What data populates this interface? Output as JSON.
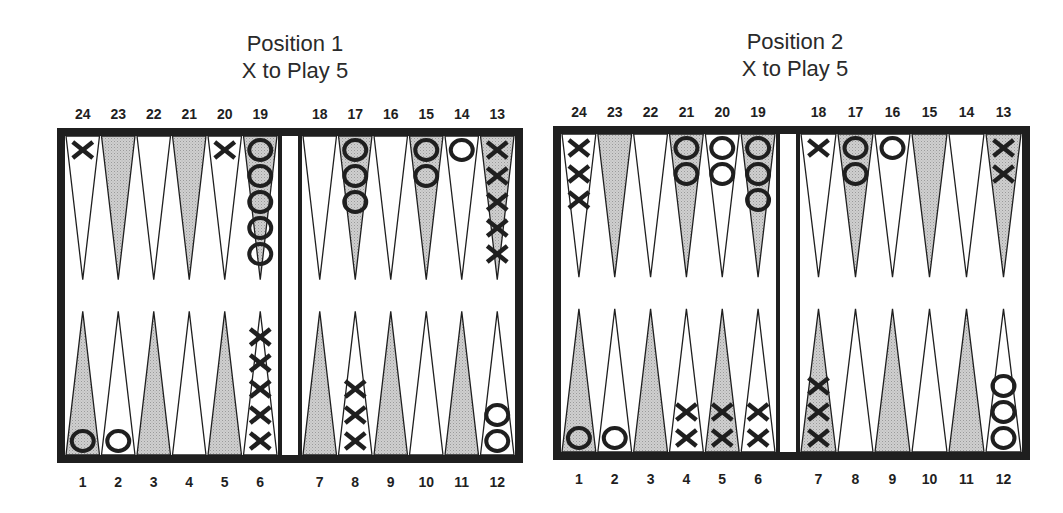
{
  "colors": {
    "ink": "#1f1f1f",
    "shaded_point": "#cfcfcf",
    "light_point": "#ffffff",
    "background": "#ffffff"
  },
  "positions": [
    {
      "title": "Position 1",
      "subtitle": "X to Play 5",
      "board": {
        "x": 57,
        "y": 128,
        "w": 466,
        "h": 335,
        "bar_x": 278,
        "bar_w": 24
      },
      "top_labels": [
        "24",
        "23",
        "22",
        "21",
        "20",
        "19",
        "18",
        "17",
        "16",
        "15",
        "14",
        "13"
      ],
      "bottom_labels": [
        "1",
        "2",
        "3",
        "4",
        "5",
        "6",
        "7",
        "8",
        "9",
        "10",
        "11",
        "12"
      ],
      "points": {
        "1": {
          "player": "O",
          "count": 1
        },
        "2": {
          "player": "O",
          "count": 1
        },
        "3": {
          "player": "",
          "count": 0
        },
        "4": {
          "player": "",
          "count": 0
        },
        "5": {
          "player": "",
          "count": 0
        },
        "6": {
          "player": "X",
          "count": 5
        },
        "7": {
          "player": "",
          "count": 0
        },
        "8": {
          "player": "X",
          "count": 3
        },
        "9": {
          "player": "",
          "count": 0
        },
        "10": {
          "player": "",
          "count": 0
        },
        "11": {
          "player": "",
          "count": 0
        },
        "12": {
          "player": "O",
          "count": 2
        },
        "13": {
          "player": "X",
          "count": 5
        },
        "14": {
          "player": "O",
          "count": 1
        },
        "15": {
          "player": "O",
          "count": 2
        },
        "16": {
          "player": "",
          "count": 0
        },
        "17": {
          "player": "O",
          "count": 3
        },
        "18": {
          "player": "",
          "count": 0
        },
        "19": {
          "player": "O",
          "count": 5
        },
        "20": {
          "player": "X",
          "count": 1
        },
        "21": {
          "player": "",
          "count": 0
        },
        "22": {
          "player": "",
          "count": 0
        },
        "23": {
          "player": "",
          "count": 0
        },
        "24": {
          "player": "X",
          "count": 1
        }
      }
    },
    {
      "title": "Position 2",
      "subtitle": "X to Play 5",
      "board": {
        "x": 553,
        "y": 126,
        "w": 477,
        "h": 334,
        "bar_x": 776,
        "bar_w": 24
      },
      "top_labels": [
        "24",
        "23",
        "22",
        "21",
        "20",
        "19",
        "18",
        "17",
        "16",
        "15",
        "14",
        "13"
      ],
      "bottom_labels": [
        "1",
        "2",
        "3",
        "4",
        "5",
        "6",
        "7",
        "8",
        "9",
        "10",
        "11",
        "12"
      ],
      "points": {
        "1": {
          "player": "O",
          "count": 1
        },
        "2": {
          "player": "O",
          "count": 1
        },
        "3": {
          "player": "",
          "count": 0
        },
        "4": {
          "player": "X",
          "count": 2
        },
        "5": {
          "player": "X",
          "count": 2
        },
        "6": {
          "player": "X",
          "count": 2
        },
        "7": {
          "player": "X",
          "count": 3
        },
        "8": {
          "player": "",
          "count": 0
        },
        "9": {
          "player": "",
          "count": 0
        },
        "10": {
          "player": "",
          "count": 0
        },
        "11": {
          "player": "",
          "count": 0
        },
        "12": {
          "player": "O",
          "count": 3
        },
        "13": {
          "player": "X",
          "count": 2
        },
        "14": {
          "player": "",
          "count": 0
        },
        "15": {
          "player": "",
          "count": 0
        },
        "16": {
          "player": "O",
          "count": 1
        },
        "17": {
          "player": "O",
          "count": 2
        },
        "18": {
          "player": "X",
          "count": 1
        },
        "19": {
          "player": "O",
          "count": 3
        },
        "20": {
          "player": "O",
          "count": 2
        },
        "21": {
          "player": "O",
          "count": 2
        },
        "22": {
          "player": "",
          "count": 0
        },
        "23": {
          "player": "",
          "count": 0
        },
        "24": {
          "player": "X",
          "count": 3
        }
      }
    }
  ]
}
